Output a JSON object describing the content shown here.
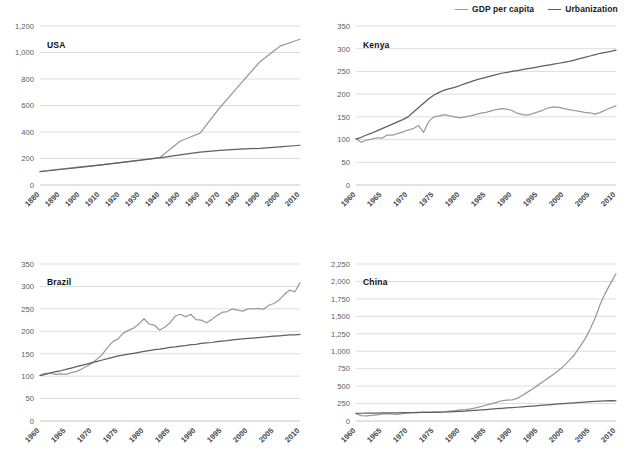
{
  "legend": {
    "position": "top-right",
    "entries": [
      {
        "label": "GDP per capita",
        "color": "#9a9a9a"
      },
      {
        "label": "Urbanization",
        "color": "#5f5f5f"
      }
    ]
  },
  "colors": {
    "gdp": "#9a9a9a",
    "urbanization": "#5f5f5f",
    "grid": "#cfcfcf",
    "axis": "#b9b9b9",
    "tick_text": "#5b5b5b",
    "title_text": "#111111",
    "background": "#ffffff"
  },
  "chart_data": [
    {
      "type": "line",
      "title": "USA",
      "xlabel": "",
      "ylabel": "",
      "grid": true,
      "xlim": [
        1880,
        2010
      ],
      "ylim": [
        0,
        1200
      ],
      "yticks": [
        "0",
        "200",
        "400",
        "600",
        "800",
        "1,000",
        "1,200"
      ],
      "ytick_values": [
        0,
        200,
        400,
        600,
        800,
        1000,
        1200
      ],
      "xticks": [
        "1880",
        "1890",
        "1900",
        "1910",
        "1920",
        "1930",
        "1940",
        "1950",
        "1960",
        "1970",
        "1980",
        "1990",
        "2000",
        "2010"
      ],
      "x": [
        1880,
        1890,
        1900,
        1910,
        1920,
        1930,
        1940,
        1950,
        1960,
        1970,
        1980,
        1990,
        2000,
        2010
      ],
      "series": [
        {
          "name": "GDP per capita",
          "color": "#9a9a9a",
          "values": [
            103,
            120,
            137,
            152,
            168,
            186,
            208,
            330,
            392,
            585,
            760,
            930,
            1048,
            1100
          ]
        },
        {
          "name": "Urbanization",
          "color": "#5f5f5f",
          "values": [
            100,
            117,
            133,
            150,
            168,
            187,
            205,
            228,
            248,
            262,
            270,
            277,
            288,
            300
          ]
        }
      ]
    },
    {
      "type": "line",
      "title": "Kenya",
      "xlabel": "",
      "ylabel": "",
      "grid": true,
      "xlim": [
        1960,
        2010
      ],
      "ylim": [
        0,
        350
      ],
      "yticks": [
        "0",
        "50",
        "100",
        "150",
        "200",
        "250",
        "300",
        "350"
      ],
      "ytick_values": [
        0,
        50,
        100,
        150,
        200,
        250,
        300,
        350
      ],
      "xticks": [
        "1960",
        "1965",
        "1970",
        "1975",
        "1980",
        "1985",
        "1990",
        "1995",
        "2000",
        "2005",
        "2010"
      ],
      "x": [
        1960,
        1961,
        1962,
        1963,
        1964,
        1965,
        1966,
        1967,
        1968,
        1969,
        1970,
        1971,
        1972,
        1973,
        1974,
        1975,
        1976,
        1977,
        1978,
        1979,
        1980,
        1981,
        1982,
        1983,
        1984,
        1985,
        1986,
        1987,
        1988,
        1989,
        1990,
        1991,
        1992,
        1993,
        1994,
        1995,
        1996,
        1997,
        1998,
        1999,
        2000,
        2001,
        2002,
        2003,
        2004,
        2005,
        2006,
        2007,
        2008,
        2009,
        2010
      ],
      "series": [
        {
          "name": "GDP per capita",
          "color": "#9a9a9a",
          "values": [
            102,
            94,
            99,
            101,
            104,
            103,
            110,
            110,
            113,
            117,
            121,
            124,
            131,
            116,
            140,
            150,
            152,
            155,
            152,
            150,
            148,
            150,
            152,
            155,
            158,
            160,
            163,
            166,
            168,
            167,
            164,
            158,
            155,
            154,
            157,
            161,
            165,
            170,
            172,
            171,
            168,
            166,
            164,
            162,
            160,
            159,
            156,
            160,
            165,
            170,
            174,
            175
          ]
        },
        {
          "name": "Urbanization",
          "color": "#5f5f5f",
          "values": [
            101,
            105,
            110,
            114,
            119,
            124,
            129,
            134,
            139,
            144,
            150,
            160,
            170,
            180,
            190,
            198,
            204,
            209,
            212,
            215,
            219,
            223,
            227,
            231,
            234,
            237,
            240,
            243,
            246,
            248,
            250,
            252,
            254,
            256,
            258,
            260,
            262,
            264,
            266,
            268,
            270,
            272,
            275,
            278,
            281,
            284,
            287,
            290,
            292,
            294,
            297
          ]
        }
      ]
    },
    {
      "type": "line",
      "title": "Brazil",
      "xlabel": "",
      "ylabel": "",
      "grid": true,
      "xlim": [
        1960,
        2010
      ],
      "ylim": [
        0,
        350
      ],
      "yticks": [
        "0",
        "50",
        "100",
        "150",
        "200",
        "250",
        "300",
        "350"
      ],
      "ytick_values": [
        0,
        50,
        100,
        150,
        200,
        250,
        300,
        350
      ],
      "xticks": [
        "1960",
        "1965",
        "1970",
        "1975",
        "1980",
        "1985",
        "1990",
        "1995",
        "2000",
        "2005",
        "2010"
      ],
      "x": [
        1960,
        1961,
        1962,
        1963,
        1964,
        1965,
        1966,
        1967,
        1968,
        1969,
        1970,
        1971,
        1972,
        1973,
        1974,
        1975,
        1976,
        1977,
        1978,
        1979,
        1980,
        1981,
        1982,
        1983,
        1984,
        1985,
        1986,
        1987,
        1988,
        1989,
        1990,
        1991,
        1992,
        1993,
        1994,
        1995,
        1996,
        1997,
        1998,
        1999,
        2000,
        2001,
        2002,
        2003,
        2004,
        2005,
        2006,
        2007,
        2008,
        2009,
        2010
      ],
      "series": [
        {
          "name": "GDP per capita",
          "color": "#9a9a9a",
          "values": [
            102,
            106,
            107,
            104,
            105,
            104,
            108,
            110,
            116,
            122,
            129,
            138,
            149,
            164,
            177,
            183,
            196,
            202,
            207,
            216,
            228,
            216,
            214,
            203,
            209,
            219,
            234,
            238,
            232,
            238,
            226,
            225,
            219,
            226,
            235,
            242,
            244,
            250,
            247,
            245,
            250,
            250,
            251,
            249,
            258,
            262,
            270,
            282,
            292,
            288,
            308
          ]
        },
        {
          "name": "Urbanization",
          "color": "#5f5f5f",
          "values": [
            101,
            104,
            107,
            110,
            112,
            115,
            118,
            121,
            124,
            127,
            130,
            133,
            136,
            139,
            142,
            145,
            147,
            149,
            151,
            153,
            155,
            157,
            159,
            160,
            162,
            164,
            165,
            167,
            168,
            170,
            171,
            173,
            174,
            175,
            177,
            178,
            179,
            181,
            182,
            183,
            184,
            185,
            186,
            187,
            188,
            189,
            190,
            191,
            192,
            192,
            193
          ]
        }
      ]
    },
    {
      "type": "line",
      "title": "China",
      "xlabel": "",
      "ylabel": "",
      "grid": true,
      "xlim": [
        1960,
        2010
      ],
      "ylim": [
        0,
        2250
      ],
      "yticks": [
        "0",
        "250",
        "500",
        "750",
        "1,000",
        "1,250",
        "1,500",
        "1,750",
        "2,000",
        "2,250"
      ],
      "ytick_values": [
        0,
        250,
        500,
        750,
        1000,
        1250,
        1500,
        1750,
        2000,
        2250
      ],
      "xticks": [
        "1960",
        "1965",
        "1970",
        "1975",
        "1980",
        "1985",
        "1990",
        "1995",
        "2000",
        "2005",
        "2010"
      ],
      "x": [
        1960,
        1961,
        1962,
        1963,
        1964,
        1965,
        1966,
        1967,
        1968,
        1969,
        1970,
        1971,
        1972,
        1973,
        1974,
        1975,
        1976,
        1977,
        1978,
        1979,
        1980,
        1981,
        1982,
        1983,
        1984,
        1985,
        1986,
        1987,
        1988,
        1989,
        1990,
        1991,
        1992,
        1993,
        1994,
        1995,
        1996,
        1997,
        1998,
        1999,
        2000,
        2001,
        2002,
        2003,
        2004,
        2005,
        2006,
        2007,
        2008,
        2009,
        2010
      ],
      "series": [
        {
          "name": "GDP per capita",
          "color": "#9a9a9a",
          "values": [
            104,
            78,
            74,
            79,
            89,
            98,
            105,
            99,
            96,
            104,
            116,
            121,
            121,
            126,
            125,
            131,
            126,
            131,
            140,
            148,
            158,
            164,
            174,
            187,
            206,
            229,
            244,
            266,
            290,
            298,
            303,
            324,
            369,
            414,
            461,
            514,
            565,
            618,
            670,
            726,
            790,
            868,
            950,
            1060,
            1170,
            1310,
            1480,
            1680,
            1840,
            1980,
            2110
          ]
        },
        {
          "name": "Urbanization",
          "color": "#5f5f5f",
          "values": [
            110,
            111,
            112,
            113,
            114,
            115,
            116,
            117,
            118,
            119,
            120,
            121,
            122,
            123,
            124,
            125,
            127,
            129,
            131,
            134,
            138,
            142,
            147,
            152,
            158,
            164,
            170,
            176,
            182,
            187,
            192,
            197,
            202,
            208,
            214,
            220,
            226,
            232,
            238,
            244,
            250,
            256,
            261,
            266,
            271,
            276,
            280,
            284,
            288,
            292,
            290
          ]
        }
      ]
    }
  ],
  "panels": [
    {
      "name": "usa",
      "title": "USA"
    },
    {
      "name": "kenya",
      "title": "Kenya"
    },
    {
      "name": "brazil",
      "title": "Brazil"
    },
    {
      "name": "china",
      "title": "China"
    }
  ]
}
